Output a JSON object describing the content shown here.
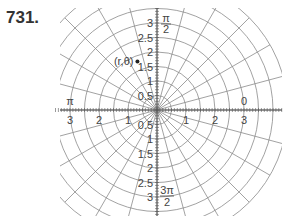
{
  "problem": {
    "number": "731."
  },
  "diagram": {
    "type": "polar-grid",
    "center": [
      157,
      110
    ],
    "unit_px": 29,
    "ring_step": 0.5,
    "max_radius": 4.5,
    "angle_step_deg": 15,
    "colors": {
      "grid": "#8a8a8a",
      "axis": "#555555",
      "text": "#444444",
      "point": "#222222"
    },
    "point": {
      "label": "(r,θ)",
      "r": 1.8,
      "theta_deg": 112
    },
    "radial_labels": [
      "0.5",
      "1",
      "1.5",
      "2",
      "2.5",
      "3"
    ],
    "horizontal_labels": [
      "1",
      "2",
      "3"
    ],
    "angle_labels": {
      "zero": "0",
      "pi": "π",
      "pi_over_2_num": "π",
      "pi_over_2_den": "2",
      "three_pi_over_2_num": "3π",
      "three_pi_over_2_den": "2"
    }
  }
}
